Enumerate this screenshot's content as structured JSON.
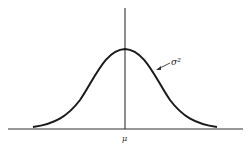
{
  "diagram": {
    "type": "normal-distribution-curve",
    "annotations": {
      "variance_label": "σ²",
      "mean_label": "μ"
    },
    "colors": {
      "line": "#1a1a1a",
      "axis": "#333333",
      "background": "#ffffff"
    }
  }
}
